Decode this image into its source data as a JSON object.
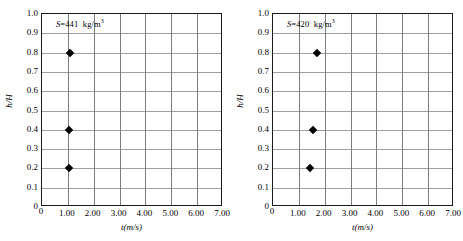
{
  "chart_data": [
    {
      "type": "scatter",
      "panel_id": "left",
      "title": "",
      "annotation": {
        "symbol": "S",
        "equals": "=",
        "value": "441",
        "unit": "kg/m",
        "unit_exponent": "3",
        "full_text": "S=441 kg/m3"
      },
      "xlabel": "t(m/s)",
      "ylabel": "h/H",
      "xlim": [
        0,
        7
      ],
      "ylim": [
        0,
        1
      ],
      "xticks": [
        0,
        1,
        2,
        3,
        4,
        5,
        6,
        7
      ],
      "xticklabels": [
        "0",
        "1.00",
        "2.00",
        "3.00",
        "4.00",
        "5.00",
        "6.00",
        "7.00"
      ],
      "yticks": [
        0,
        0.1,
        0.2,
        0.3,
        0.4,
        0.5,
        0.6,
        0.7,
        0.8,
        0.9,
        1.0
      ],
      "yticklabels": [
        "0",
        "0.1",
        "0.2",
        "0.3",
        "0.4",
        "0.5",
        "0.6",
        "0.7",
        "0.8",
        "0.9",
        "1.0"
      ],
      "grid": true,
      "grid_vertical_at": [
        1,
        2,
        3,
        4,
        5,
        6
      ],
      "legend": null,
      "marker": "filled-diamond",
      "x": [
        1.1,
        1.05,
        1.05
      ],
      "y": [
        0.8,
        0.4,
        0.2
      ],
      "points": [
        {
          "x": 1.1,
          "y": 0.8
        },
        {
          "x": 1.05,
          "y": 0.4
        },
        {
          "x": 1.05,
          "y": 0.2
        }
      ]
    },
    {
      "type": "scatter",
      "panel_id": "right",
      "title": "",
      "annotation": {
        "symbol": "S",
        "equals": "=",
        "value": "420",
        "unit": "kg/m",
        "unit_exponent": "3",
        "full_text": "S=420 kg/m3"
      },
      "xlabel": "t(m/s)",
      "ylabel": "h/H",
      "xlim": [
        0,
        7
      ],
      "ylim": [
        0,
        1
      ],
      "xticks": [
        0,
        1,
        2,
        3,
        4,
        5,
        6,
        7
      ],
      "xticklabels": [
        "0",
        "1.00",
        "2.00",
        "3.00",
        "4.00",
        "5.00",
        "6.00",
        "7.00"
      ],
      "yticks": [
        0,
        0.1,
        0.2,
        0.3,
        0.4,
        0.5,
        0.6,
        0.7,
        0.8,
        0.9,
        1.0
      ],
      "yticklabels": [
        "0",
        "0.1",
        "0.2",
        "0.3",
        "0.4",
        "0.5",
        "0.6",
        "0.7",
        "0.8",
        "0.9",
        "1.0"
      ],
      "grid": true,
      "grid_vertical_at": [
        1,
        2,
        3,
        4,
        5,
        6
      ],
      "legend": null,
      "marker": "filled-diamond",
      "x": [
        1.7,
        1.55,
        1.45
      ],
      "y": [
        0.8,
        0.4,
        0.2
      ],
      "points": [
        {
          "x": 1.7,
          "y": 0.8
        },
        {
          "x": 1.55,
          "y": 0.4
        },
        {
          "x": 1.45,
          "y": 0.2
        }
      ]
    }
  ],
  "colors": {
    "background": "#ffffff",
    "frame": "#1a1a1a",
    "gridline_horizontal": "#9e9e9e",
    "gridline_vertical": "#7d7d7d",
    "marker": "#000000",
    "text": "#000000"
  }
}
